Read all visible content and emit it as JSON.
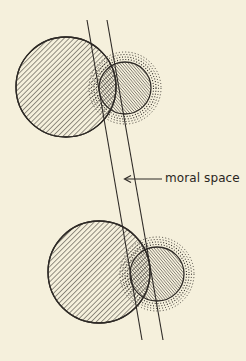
{
  "diagram": {
    "annotation": {
      "text": "moral space",
      "arrow": "left-arrow"
    },
    "colors": {
      "background": "#f5f0dc",
      "ink": "#2e2a26"
    },
    "groups": [
      {
        "id": "top",
        "large_circle": {
          "cx": 66,
          "cy": 87,
          "r": 50,
          "fill": "diagonal-hatch-back"
        },
        "small_circle": {
          "cx": 125,
          "cy": 88,
          "r": 26,
          "fill": "diagonal-hatch-forward-dense",
          "halo": "dotted-rings"
        }
      },
      {
        "id": "bottom",
        "large_circle": {
          "cx": 99,
          "cy": 272,
          "r": 51,
          "fill": "diagonal-hatch-back"
        },
        "small_circle": {
          "cx": 157,
          "cy": 274,
          "r": 27,
          "fill": "diagonal-hatch-forward-dense",
          "halo": "dotted-rings"
        }
      }
    ],
    "lines": [
      {
        "x1": 87,
        "y1": 20,
        "x2": 142,
        "y2": 340
      },
      {
        "x1": 107,
        "y1": 20,
        "x2": 163,
        "y2": 340
      }
    ]
  }
}
